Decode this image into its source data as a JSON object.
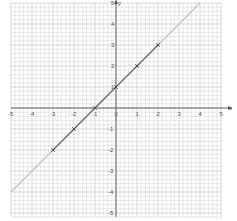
{
  "chart_data": {
    "type": "line",
    "title": "",
    "xlabel": "x",
    "ylabel": "y",
    "xlim": [
      -5,
      5
    ],
    "ylim": [
      -5,
      5
    ],
    "grid": true,
    "minor_subdivisions": 5,
    "x_ticks": [
      "-5",
      "-4",
      "-3",
      "-2",
      "-1",
      "0",
      "1",
      "2",
      "3",
      "4",
      "5"
    ],
    "y_ticks": [
      "-5",
      "-4",
      "-3",
      "-2",
      "-1",
      "1",
      "2",
      "3",
      "4",
      "5"
    ],
    "series": [
      {
        "name": "y = x + 1",
        "line_extent": {
          "x": [
            -5,
            4
          ],
          "y": [
            -4,
            5
          ]
        },
        "points": [
          {
            "x": -3,
            "y": -2
          },
          {
            "x": -2,
            "y": -1
          },
          {
            "x": -1,
            "y": 0
          },
          {
            "x": 0,
            "y": 1
          },
          {
            "x": 1,
            "y": 2
          },
          {
            "x": 2,
            "y": 3
          }
        ]
      }
    ],
    "colors": {
      "grid_minor": "#d8d8d8",
      "grid_major": "#bcbcbc",
      "axis": "#555555",
      "line_light": "#bdbdbd",
      "line_dark": "#6a6a6a",
      "marker": "#444444"
    }
  }
}
